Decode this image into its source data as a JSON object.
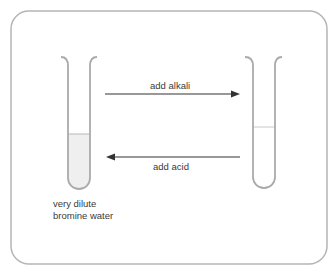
{
  "diagram": {
    "left_tube": {
      "label_line1": "very dilute",
      "label_line2": "bromine water",
      "liquid_color": "#efefef"
    },
    "right_tube": {
      "liquid_color": "#ffffff"
    },
    "arrow_forward": {
      "label": "add alkali",
      "direction": "right"
    },
    "arrow_backward": {
      "label": "add acid",
      "direction": "left"
    },
    "colors": {
      "frame": "#b5b5b5",
      "tube": "#aaaaaa",
      "arrow": "#333333"
    }
  }
}
